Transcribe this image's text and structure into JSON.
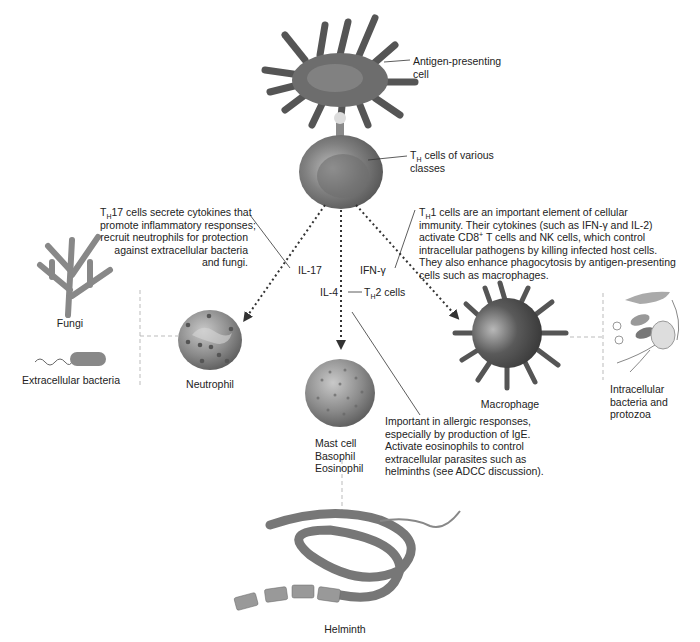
{
  "diagram": {
    "nodes": {
      "apc": {
        "label": "Antigen-presenting cell",
        "line1": "Antigen-presenting",
        "line2": "cell"
      },
      "th": {
        "label_prefix": "T",
        "label_sub": "H",
        "line1_rest": " cells of various",
        "line2": "classes"
      },
      "neutrophil": {
        "label": "Neutrophil"
      },
      "mast": {
        "line1": "Mast cell",
        "line2": "Basophil",
        "line3": "Eosinophil"
      },
      "macrophage": {
        "label": "Macrophage"
      },
      "fungi": {
        "label": "Fungi"
      },
      "ext_bacteria": {
        "label": "Extracellular bacteria"
      },
      "intracellular": {
        "line1": "Intracellular",
        "line2": "bacteria and",
        "line3": "protozoa"
      },
      "helminth": {
        "label": "Helminth"
      }
    },
    "edges": {
      "il17": {
        "label": "IL-17",
        "from": "th",
        "to": "neutrophil",
        "style": "dotted-arrow"
      },
      "il4": {
        "label": "IL-4",
        "from": "th",
        "to": "mast",
        "style": "dotted-arrow"
      },
      "ifng": {
        "label": "IFN-γ",
        "from": "th",
        "to": "macrophage",
        "style": "dotted-arrow"
      },
      "th2": {
        "prefix": "T",
        "sub": "H",
        "rest": "2 cells"
      }
    },
    "annotations": {
      "th17": {
        "prefix": "T",
        "sub": "H",
        "line1_rest": "17 cells secrete cytokines that",
        "line2": "promote inflammatory responses;",
        "line3": "recruit neutrophils for protection",
        "line4": "against extracellular bacteria",
        "line5": "and fungi."
      },
      "th1": {
        "prefix": "T",
        "sub": "H",
        "line1_rest": "1 cells are an important element of cellular",
        "line2": "immunity. Their cytokines (such as IFN-γ and IL-2)",
        "line3_a": "activate CD8",
        "line3_sup": "+",
        "line3_b": " T cells and NK cells, which control",
        "line4": "intracellular pathogens by killing infected host cells.",
        "line5": "They also enhance phagocytosis by antigen-presenting",
        "line6": "cells such as macrophages."
      },
      "th2": {
        "line1": "Important in allergic responses,",
        "line2": "especially by production of IgE.",
        "line3": "Activate eosinophils to control",
        "line4": "extracellular parasites such as",
        "line5": "helminths (see ADCC discussion)."
      }
    }
  }
}
